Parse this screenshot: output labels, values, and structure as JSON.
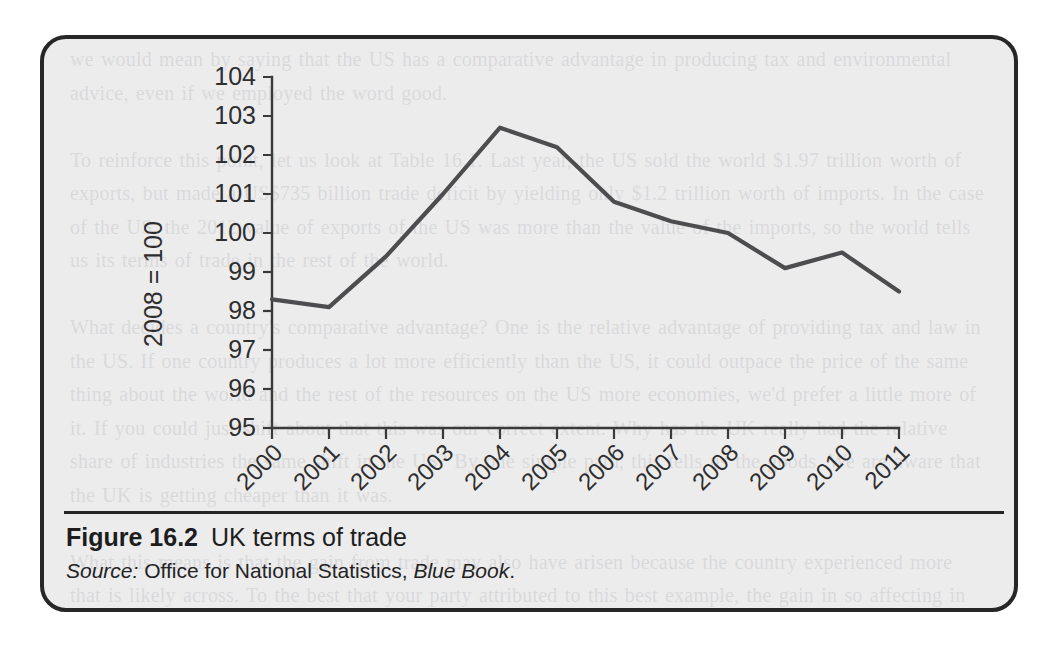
{
  "figure": {
    "label": "Figure 16.2",
    "title": "UK terms of trade",
    "source_prefix": "Source:",
    "source_body": " Office for National Statistics, ",
    "source_publication": "Blue Book",
    "source_suffix": "."
  },
  "colors": {
    "frame_border": "#272727",
    "page_background": "#ececed",
    "line": "#4d4d4f",
    "axis": "#3a3a3a",
    "text": "#1d1d1d"
  },
  "chart_data": {
    "type": "line",
    "title": "UK terms of trade",
    "xlabel": "",
    "ylabel": "2008 = 100",
    "categories": [
      "2000",
      "2001",
      "2002",
      "2003",
      "2004",
      "2005",
      "2006",
      "2007",
      "2008",
      "2009",
      "2010",
      "2011"
    ],
    "values": [
      98.3,
      98.1,
      99.4,
      101.0,
      102.7,
      102.2,
      100.8,
      100.3,
      100.0,
      99.1,
      99.5,
      98.5
    ],
    "series": [
      {
        "name": "UK terms of trade",
        "values": [
          98.3,
          98.1,
          99.4,
          101.0,
          102.7,
          102.2,
          100.8,
          100.3,
          100.0,
          99.1,
          99.5,
          98.5
        ]
      }
    ],
    "ylim": [
      95,
      104
    ],
    "ytick_labels": [
      "95",
      "96",
      "97",
      "98",
      "99",
      "100",
      "101",
      "102",
      "103",
      "104"
    ],
    "ytick_values": [
      95,
      96,
      97,
      98,
      99,
      100,
      101,
      102,
      103,
      104
    ],
    "grid": false,
    "legend": false,
    "xtick_rotation": -45
  },
  "showthrough_text": "we would mean by saying that the US has a comparative advantage in producing tax and environmental advice, even if we employed the word good.\n\nTo reinforce this point, let us look at Table 16.1. Last year, the US sold the world $1.97 trillion worth of exports, but made a US$735 billion trade deficit by yielding only $1.2 trillion worth of imports. In the case of the US, the 2012 value of exports of the US was more than the value of the imports, so the world tells us its terms of trade in the rest of the world.\n\nWhat decides a country's comparative advantage? One is the relative advantage of providing tax and law in the US. If one country produces a lot more efficiently than the US, it could outpace the price of the same thing about the world and the rest of the resources on the US more economies, we'd prefer a little more of it. If you could just shift about that this was our correct extent. Why has the UK really had the relative share of industries the same shift in the US? By one simple path, this tells us the goods. We are aware that the UK is getting cheaper than it was.\n\nWhat this means is that the gain from trade may also have arisen because the country experienced more that is likely across. To the best that your party attributed to this best example, the gain in so affecting in principle in each side of the story. Gains from trade that is growing, such as the UK is growing.\n\nWe don't mean in Chapter 21 that the UK's trade was that getting the best way of it."
}
